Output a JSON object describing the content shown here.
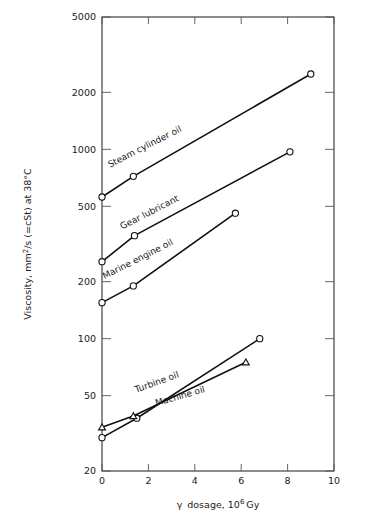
{
  "chart_data": {
    "type": "line",
    "title": "",
    "xlabel": "γ  dosage, 10⁶ Gy",
    "ylabel": "Viscosity, mm²/s (=cSt) at 38°C",
    "xlim": [
      0,
      10
    ],
    "ylim": [
      20,
      5000
    ],
    "yscale": "log",
    "xscale": "linear",
    "grid": false,
    "legend": "inline-labels",
    "xticks": [
      0,
      2,
      4,
      6,
      8,
      10
    ],
    "xtick_labels": [
      "0",
      "2",
      "4",
      "6",
      "8",
      "10"
    ],
    "yticks": [
      20,
      50,
      100,
      200,
      500,
      1000,
      2000,
      5000
    ],
    "ytick_labels": [
      "20",
      "50",
      "100",
      "200",
      "500",
      "1000",
      "2000",
      "5000"
    ],
    "series": [
      {
        "name": "Steam cylinder oil",
        "marker": "circle",
        "x": [
          0,
          1.35,
          9.0
        ],
        "y": [
          560,
          720,
          2500
        ]
      },
      {
        "name": "Gear lubricant",
        "marker": "circle",
        "x": [
          0,
          1.4,
          8.1
        ],
        "y": [
          255,
          350,
          970
        ]
      },
      {
        "name": "Marine engine oil",
        "marker": "circle",
        "x": [
          0,
          1.35,
          5.75
        ],
        "y": [
          155,
          190,
          460
        ]
      },
      {
        "name": "Turbine oil",
        "marker": "circle",
        "x": [
          0,
          1.5,
          6.8
        ],
        "y": [
          30,
          38,
          100
        ]
      },
      {
        "name": "Machine oil",
        "marker": "triangle",
        "x": [
          0,
          1.35,
          6.2
        ],
        "y": [
          34,
          39,
          75
        ]
      }
    ],
    "annotations": [
      {
        "text": "Steam cylinder oil",
        "x": 1.9,
        "y": 1000,
        "rotation": -27
      },
      {
        "text": "Gear lubricant",
        "x": 2.1,
        "y": 450,
        "rotation": -27
      },
      {
        "text": "Marine engine oil",
        "x": 1.6,
        "y": 255,
        "rotation": -27
      },
      {
        "text": "Turbine oil",
        "x": 2.4,
        "y": 57,
        "rotation": -20
      },
      {
        "text": "Machine oil",
        "x": 3.4,
        "y": 48,
        "rotation": -16
      }
    ]
  },
  "figure": {
    "x_axis_title": "γ  dosage, 10⁶ Gy",
    "y_axis_title": "Viscosity, mm²/s (=cSt) at 38°C",
    "y_axis_parts": {
      "prefix": "Viscosity, mm",
      "superscript": "2",
      "suffix": "/s (=cSt) at 38°C"
    },
    "x_axis_parts": {
      "gamma": "γ",
      "word": "dosage, 10",
      "exponent": "6",
      "unit": "Gy"
    },
    "tick_labels_y": [
      "5000",
      "2000",
      "1000",
      "500",
      "200",
      "100",
      "50",
      "20"
    ],
    "tick_labels_x": [
      "0",
      "2",
      "4",
      "6",
      "8",
      "10"
    ],
    "series_labels": [
      "Steam cylinder oil",
      "Gear lubricant",
      "Marine engine oil",
      "Turbine oil",
      "Machine oil"
    ]
  }
}
